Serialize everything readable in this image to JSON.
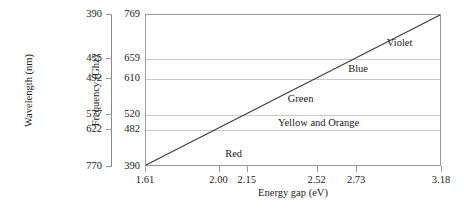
{
  "chart_data": {
    "type": "line",
    "title": "",
    "xlabel": "Energy gap (eV)",
    "ylabel": "Frequency (Ghz)",
    "y2label": "Wavelength (nm)",
    "grid": true,
    "legend": "none",
    "xlim": [
      1.61,
      3.18
    ],
    "ylim": [
      390,
      769
    ],
    "x_ticks": [
      {
        "value": 1.61,
        "label": "1.61"
      },
      {
        "value": 2.0,
        "label": "2.00"
      },
      {
        "value": 2.15,
        "label": "2.15"
      },
      {
        "value": 2.52,
        "label": "2.52"
      },
      {
        "value": 2.73,
        "label": "2.73"
      },
      {
        "value": 3.18,
        "label": "3.18"
      }
    ],
    "y_ticks": [
      {
        "value": 390,
        "label": "390"
      },
      {
        "value": 482,
        "label": "482"
      },
      {
        "value": 520,
        "label": "520"
      },
      {
        "value": 610,
        "label": "610"
      },
      {
        "value": 659,
        "label": "659"
      },
      {
        "value": 769,
        "label": "769"
      }
    ],
    "y2_ticks": [
      {
        "frequency": 769,
        "label": "390"
      },
      {
        "frequency": 659,
        "label": "455"
      },
      {
        "frequency": 610,
        "label": "492"
      },
      {
        "frequency": 520,
        "label": "577"
      },
      {
        "frequency": 482,
        "label": "622"
      },
      {
        "frequency": 390,
        "label": "770"
      }
    ],
    "gridlines_at": [
      482,
      520,
      610,
      659
    ],
    "series": [
      {
        "name": "frequency vs energy gap",
        "x": [
          1.61,
          3.18
        ],
        "y": [
          390,
          769
        ],
        "color": "#3a3a3a"
      }
    ],
    "annotations": [
      {
        "text": "Red",
        "x": 2.075,
        "y": 423
      },
      {
        "text": "Yellow and Orange",
        "x": 2.525,
        "y": 500
      },
      {
        "text": "Green",
        "x": 2.43,
        "y": 560
      },
      {
        "text": "Blue",
        "x": 2.735,
        "y": 634
      },
      {
        "text": "Violet",
        "x": 2.955,
        "y": 700
      }
    ]
  },
  "colors": {
    "frame": "#9a9a9a",
    "grid": "#c9c9c9",
    "line": "#3a3a3a",
    "text": "#1a1a1a",
    "background": "#ffffff"
  }
}
